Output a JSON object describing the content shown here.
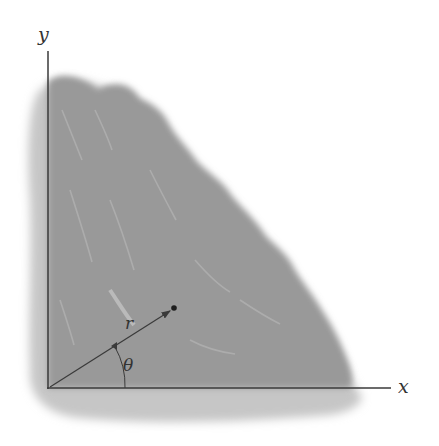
{
  "diagram": {
    "type": "polar-coordinates-region",
    "axes": {
      "y_label": "y",
      "x_label": "x"
    },
    "vector": {
      "label": "r",
      "angle_label": "θ"
    },
    "colors": {
      "region_fill": "#9a9a9a",
      "region_shadow": "#c4c4c4",
      "axis_line": "#3a3a3a",
      "background": "#ffffff"
    }
  }
}
